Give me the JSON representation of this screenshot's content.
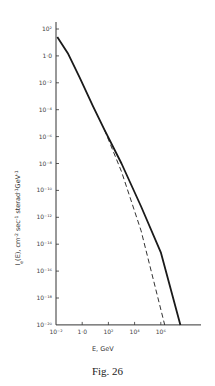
{
  "chart_data": {
    "type": "line",
    "title": "",
    "caption": "Fig. 26",
    "xlabel": "E,  GeV",
    "ylabel": "I_e(E),  cm^-2 sec^-1 sterad^-1 GeV^-1",
    "xscale": "log",
    "yscale": "log",
    "xlim_log10": [
      -2,
      8.5
    ],
    "ylim_log10": [
      -20,
      2
    ],
    "x_ticks": [
      {
        "log": -2,
        "label": "10⁻²"
      },
      {
        "log": 0,
        "label": "1·0"
      },
      {
        "log": 2,
        "label": "10²"
      },
      {
        "log": 4,
        "label": "10⁴"
      },
      {
        "log": 6,
        "label": "10⁶"
      }
    ],
    "y_ticks": [
      {
        "log": 2,
        "label": "10²"
      },
      {
        "log": 0,
        "label": "1·0"
      },
      {
        "log": -2,
        "label": "10⁻²"
      },
      {
        "log": -4,
        "label": "10⁻⁴"
      },
      {
        "log": -6,
        "label": "10⁻⁶"
      },
      {
        "log": -8,
        "label": "10⁻⁸"
      },
      {
        "log": -10,
        "label": "10⁻¹⁰"
      },
      {
        "log": -12,
        "label": "10⁻¹²"
      },
      {
        "log": -14,
        "label": "10⁻¹⁴"
      },
      {
        "log": -16,
        "label": "10⁻¹⁶"
      },
      {
        "log": -18,
        "label": "10⁻¹⁸"
      },
      {
        "log": -20,
        "label": "10⁻²⁰"
      }
    ],
    "grid": false,
    "legend": null,
    "series": [
      {
        "name": "solid",
        "style": "solid",
        "log10_E": [
          -1.9,
          -1.1,
          -0.2,
          0.8,
          1.7,
          3.0,
          4.5,
          6.0,
          7.5
        ],
        "log10_I": [
          1.4,
          0.2,
          -1.6,
          -3.7,
          -5.5,
          -8.0,
          -11.2,
          -14.6,
          -20.0
        ]
      },
      {
        "name": "dashed",
        "style": "dashed",
        "log10_E": [
          1.7,
          3.0,
          4.5,
          6.3
        ],
        "log10_I": [
          -5.5,
          -8.6,
          -13.0,
          -20.0
        ]
      }
    ]
  }
}
